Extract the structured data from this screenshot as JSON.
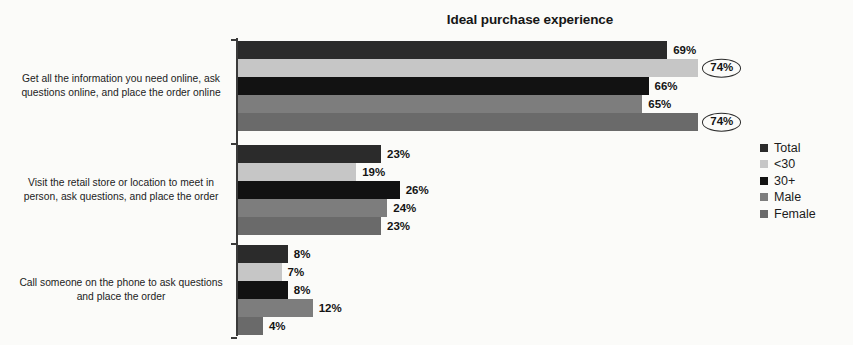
{
  "chart_data": {
    "type": "bar",
    "orientation": "horizontal",
    "title": "Ideal purchase experience",
    "xlabel": "",
    "ylabel": "",
    "xlim": [
      0,
      80
    ],
    "grid": false,
    "legend_position": "right",
    "value_suffix": "%",
    "categories": [
      "Get all the information you need online, ask questions online, and place the order online",
      "Visit the retail store or location to meet in person, ask questions, and place the order",
      "Call someone on the phone to ask questions and place the order"
    ],
    "series": [
      {
        "name": "Total",
        "color": "#2b2b2b",
        "values": [
          69,
          23,
          8
        ]
      },
      {
        "name": "<30",
        "color": "#c6c6c6",
        "values": [
          74,
          19,
          7
        ]
      },
      {
        "name": "30+",
        "color": "#121212",
        "values": [
          66,
          26,
          8
        ]
      },
      {
        "name": "Male",
        "color": "#7d7d7d",
        "values": [
          65,
          24,
          12
        ]
      },
      {
        "name": "Female",
        "color": "#6a6a6a",
        "values": [
          74,
          23,
          4
        ]
      }
    ],
    "labels": [
      [
        "69%",
        "74%",
        "66%",
        "65%",
        "74%"
      ],
      [
        "23%",
        "19%",
        "26%",
        "24%",
        "23%"
      ],
      [
        "8%",
        "7%",
        "8%",
        "12%",
        "4%"
      ]
    ],
    "highlighted": [
      {
        "group": 0,
        "series": 1,
        "label": "74%"
      },
      {
        "group": 0,
        "series": 4,
        "label": "74%"
      }
    ]
  },
  "legend": {
    "items": [
      {
        "label": "Total",
        "color": "#2b2b2b"
      },
      {
        "label": "<30",
        "color": "#c6c6c6"
      },
      {
        "label": "30+",
        "color": "#121212"
      },
      {
        "label": "Male",
        "color": "#7d7d7d"
      },
      {
        "label": "Female",
        "color": "#6a6a6a"
      }
    ]
  }
}
